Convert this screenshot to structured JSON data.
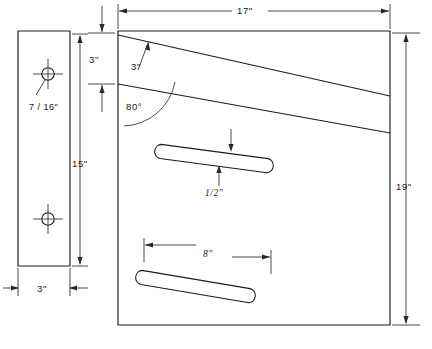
{
  "drawing": {
    "title": "Sheet metal bracket fabrication drawing",
    "type": "mechanical-engineering-drawing",
    "background_color": "#ffffff",
    "line_color": "#1c1c1c",
    "dimension_color": "#2a2a2a",
    "views": [
      {
        "name": "side-view",
        "description": "Narrow vertical side profile plate with two holes",
        "position": "left"
      },
      {
        "name": "front-view",
        "description": "Large panel with two angled obround slots and two sloped fold lines",
        "position": "right"
      }
    ],
    "dimensions": [
      {
        "id": "side-width",
        "label": "3\"",
        "view": "side-view",
        "orientation": "horizontal",
        "placement": "below"
      },
      {
        "id": "side-height",
        "label": "15\"",
        "view": "side-view",
        "orientation": "vertical",
        "placement": "right"
      },
      {
        "id": "hole-diameter",
        "label": "7 / 16\"",
        "view": "side-view",
        "orientation": "leader",
        "placement": "below-left-of-hole"
      },
      {
        "id": "panel-width",
        "label": "17\"",
        "view": "front-view",
        "orientation": "horizontal",
        "placement": "above"
      },
      {
        "id": "panel-height",
        "label": "19\"",
        "view": "front-view",
        "orientation": "vertical",
        "placement": "right"
      },
      {
        "id": "top-flange",
        "label": "3\"",
        "view": "front-view",
        "orientation": "vertical",
        "placement": "left-edge"
      },
      {
        "id": "fold-offset",
        "label": "3\"",
        "view": "front-view",
        "orientation": "leader",
        "placement": "upper-area"
      },
      {
        "id": "fold-angle",
        "label": "80°",
        "view": "front-view",
        "orientation": "angular",
        "placement": "upper-left-interior"
      },
      {
        "id": "slot-width",
        "label": "1/2\"",
        "view": "front-view",
        "orientation": "vertical",
        "placement": "upper-slot"
      },
      {
        "id": "slot-length",
        "label": "8\"",
        "view": "front-view",
        "orientation": "horizontal",
        "placement": "above-lower-slot"
      }
    ],
    "features": [
      {
        "id": "upper-hole",
        "shape": "circle-with-centerlines",
        "view": "side-view"
      },
      {
        "id": "lower-hole",
        "shape": "circle-with-centerlines",
        "view": "side-view"
      },
      {
        "id": "upper-slot",
        "shape": "obround-angled",
        "view": "front-view"
      },
      {
        "id": "lower-slot",
        "shape": "obround-angled",
        "view": "front-view"
      }
    ]
  },
  "labels": {
    "side_width": "3\"",
    "side_height": "15\"",
    "hole_dia": "7 / 16\"",
    "panel_width": "17\"",
    "panel_height": "19\"",
    "top_flange": "3\"",
    "fold_offset": "3\"",
    "fold_angle": "80°",
    "slot_width": "1/2\"",
    "slot_length": "8\""
  }
}
